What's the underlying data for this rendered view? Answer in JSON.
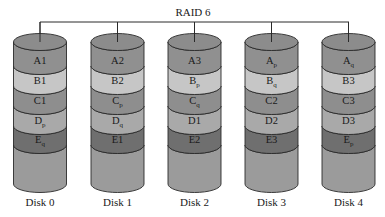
{
  "title": "RAID 6",
  "colors": {
    "top": "#8c8c8c",
    "bandA": "#909090",
    "bandB": "#c6c6c6",
    "bandC": "#8e8e8e",
    "bandD": "#a9a9a9",
    "bandE": "#6f6f6f",
    "bottom": "#9b9b9b",
    "stroke": "#2a2a2a"
  },
  "disks": [
    {
      "label": "Disk 0",
      "blocks": [
        {
          "base": "A",
          "sub": "1"
        },
        {
          "base": "B",
          "sub": "1"
        },
        {
          "base": "C",
          "sub": "1"
        },
        {
          "base": "D",
          "sub": "p"
        },
        {
          "base": "E",
          "sub": "q"
        }
      ]
    },
    {
      "label": "Disk 1",
      "blocks": [
        {
          "base": "A",
          "sub": "2"
        },
        {
          "base": "B",
          "sub": "2"
        },
        {
          "base": "C",
          "sub": "p"
        },
        {
          "base": "D",
          "sub": "q"
        },
        {
          "base": "E",
          "sub": "1"
        }
      ]
    },
    {
      "label": "Disk 2",
      "blocks": [
        {
          "base": "A",
          "sub": "3"
        },
        {
          "base": "B",
          "sub": "p"
        },
        {
          "base": "C",
          "sub": "q"
        },
        {
          "base": "D",
          "sub": "1"
        },
        {
          "base": "E",
          "sub": "2"
        }
      ]
    },
    {
      "label": "Disk 3",
      "blocks": [
        {
          "base": "A",
          "sub": "p"
        },
        {
          "base": "B",
          "sub": "q"
        },
        {
          "base": "C",
          "sub": "2"
        },
        {
          "base": "D",
          "sub": "2"
        },
        {
          "base": "E",
          "sub": "3"
        }
      ]
    },
    {
      "label": "Disk 4",
      "blocks": [
        {
          "base": "A",
          "sub": "q"
        },
        {
          "base": "B",
          "sub": "3"
        },
        {
          "base": "C",
          "sub": "3"
        },
        {
          "base": "D",
          "sub": "3"
        },
        {
          "base": "E",
          "sub": "p"
        }
      ]
    }
  ]
}
